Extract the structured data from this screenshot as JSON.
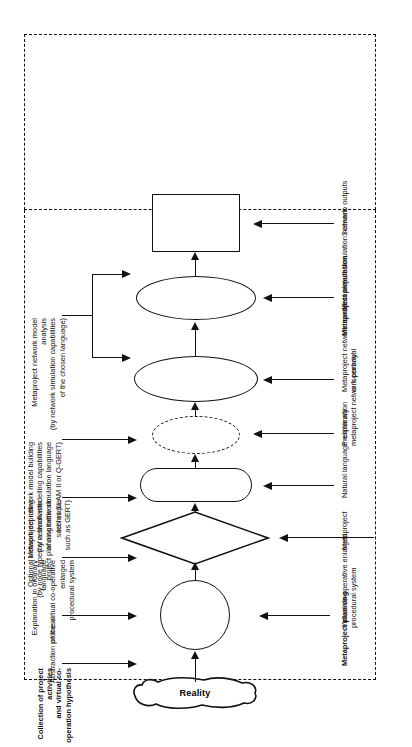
{
  "diagram": {
    "reality_label": "Reality",
    "sections": [
      {
        "id": "planning",
        "label": "Metaproject planning"
      },
      {
        "id": "simulation",
        "label": "Metaproject simulation"
      }
    ],
    "top_labels": [
      {
        "id": "collection",
        "text": "Collection of project activities\nand virtual co-operation hypothesis",
        "bold": true
      },
      {
        "id": "abstraction",
        "text": "Abstraction process",
        "bold": false
      },
      {
        "id": "explanation",
        "text": "Explanation in ordinary language\nof the virtual co-operative enlarged\nprocedural system",
        "bold": false
      },
      {
        "id": "optional-network",
        "text": "Optional network depicting\n(by node types of a stochastic\nproject planning network technique\nsuch as GERT)",
        "bold": false
      },
      {
        "id": "model-building",
        "text": "Metaproject network model building\n(by network modelling capabilities\nof a suitable simulation language\nsuch as SLAM II or Q-GERT)",
        "bold": false
      },
      {
        "id": "model-analysis",
        "text": "Metaproject network model analysis\n(by network simulation capabilities\nof the chosen language)",
        "bold": false
      }
    ],
    "bottom_labels": [
      {
        "id": "section-planning",
        "text": "Metaproject planning",
        "bold": true
      },
      {
        "id": "virtual-system",
        "text": "Virtual co-operative enlarged\nprocedural system",
        "bold": false
      },
      {
        "id": "metaproject",
        "text": "Metaproject",
        "bold": false
      },
      {
        "id": "natural-language",
        "text": "Natural language explanation",
        "bold": false
      },
      {
        "id": "preliminary-portrayal",
        "text": "Preliminary\nmetaproject network portrayal",
        "bold": false
      },
      {
        "id": "network-model-scenario",
        "text": "Metaproject network model\nor 'scenario'",
        "bold": false
      },
      {
        "id": "section-simulation",
        "text": "Metaproject simulation",
        "bold": true
      },
      {
        "id": "simulation-network",
        "text": "Metaproject simulation network",
        "bold": false
      },
      {
        "id": "scenario-outputs",
        "text": "Scenario outputs",
        "bold": false
      }
    ],
    "shapes": [
      {
        "id": "reality-cloud",
        "kind": "cloud"
      },
      {
        "id": "circle-node",
        "kind": "circle"
      },
      {
        "id": "diamond-node",
        "kind": "diamond"
      },
      {
        "id": "rounded-rect-node",
        "kind": "rounded-rect"
      },
      {
        "id": "dashed-ellipse-node",
        "kind": "dashed-ellipse"
      },
      {
        "id": "ellipse-node-1",
        "kind": "ellipse"
      },
      {
        "id": "ellipse-node-2",
        "kind": "ellipse"
      },
      {
        "id": "rect-node",
        "kind": "rect"
      }
    ],
    "colors": {
      "ink": "#111111",
      "paper": "#ffffff"
    }
  }
}
